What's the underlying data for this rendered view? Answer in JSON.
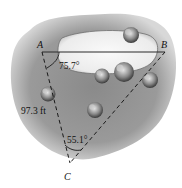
{
  "diagram": {
    "type": "surveying-triangle",
    "points": {
      "A": {
        "label": "A"
      },
      "B": {
        "label": "B"
      },
      "C": {
        "label": "C"
      }
    },
    "measurements": {
      "angle_A": "75.7°",
      "side_AC": "97.3 ft",
      "angle_C": "55.1°"
    },
    "features": {
      "pond": "pond",
      "trees": [
        "tree",
        "tree",
        "tree",
        "tree",
        "tree",
        "tree"
      ]
    },
    "colors": {
      "terrain": "#8c8c8c",
      "terrain_edge": "#c8c8c8",
      "pond": "#f4f4f4",
      "lines": "#222222"
    }
  }
}
